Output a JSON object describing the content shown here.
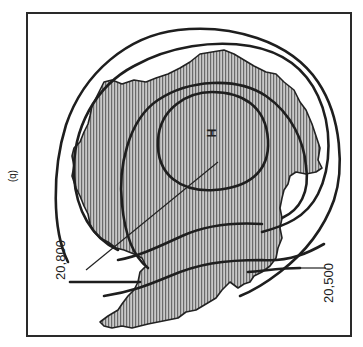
{
  "figure": {
    "panel_label": "(b)",
    "high_marker": "H",
    "contour_labels": [
      {
        "value": "20,800"
      },
      {
        "value": "20,500"
      }
    ]
  },
  "colors": {
    "ink": "#222222",
    "land_fill": "#bdbdbd",
    "hatch": "#6a6a6a",
    "background": "#ffffff"
  }
}
